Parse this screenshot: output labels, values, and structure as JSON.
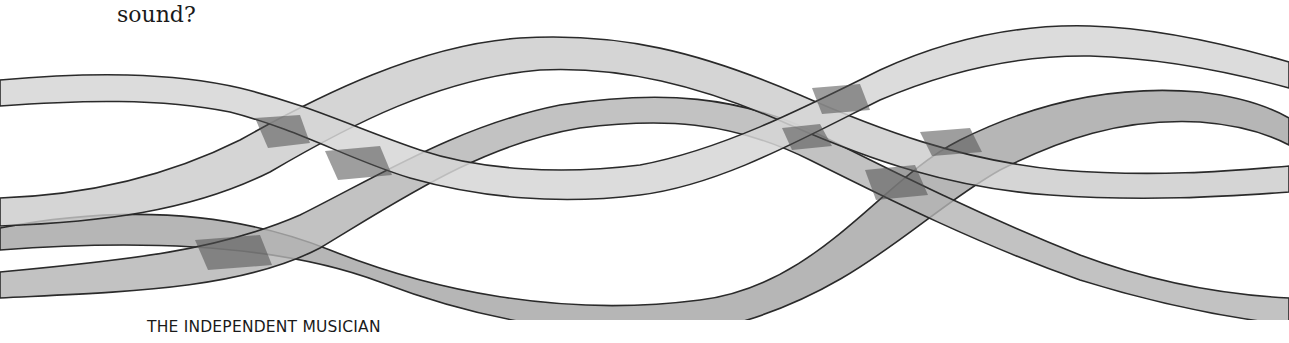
{
  "page": {
    "body_text": {
      "previous_line_partial": "",
      "last_line": "sound?"
    },
    "illustration": {
      "description": "four intertwined translucent grey ribbons crossing across the page",
      "ribbons": [
        {
          "name": "ribbon-a",
          "fill": "#d2d2d2"
        },
        {
          "name": "ribbon-b",
          "fill": "#c8c8c8"
        },
        {
          "name": "ribbon-c",
          "fill": "#a8a8a8"
        },
        {
          "name": "ribbon-d",
          "fill": "#b2b2b2"
        }
      ],
      "outline_color": "#2a2a2a",
      "crossing_color": "#555555"
    },
    "footer": {
      "running_title": "THE INDEPENDENT MUSICIAN"
    }
  }
}
